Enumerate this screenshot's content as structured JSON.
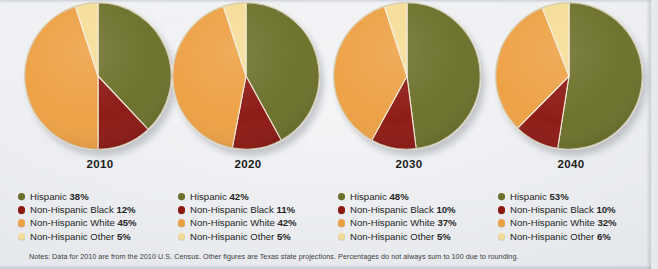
{
  "background_color": "#e7e9ec",
  "palette": {
    "hispanic": "#6b7029",
    "non_hispanic_black": "#8c1812",
    "non_hispanic_white": "#eda043",
    "non_hispanic_other": "#f5dc96"
  },
  "notes": "Notes: Data for 2010 are from the 2010 U.S. Census. Other figures are Texas state projections. Percentages do not always sum to 100 due to rounding.",
  "chart_data": [
    {
      "type": "pie",
      "title": "2010",
      "categories": [
        "Hispanic",
        "Non-Hispanic Black",
        "Non-Hispanic White",
        "Non-Hispanic Other"
      ],
      "values": [
        38,
        12,
        45,
        5
      ],
      "labels": [
        "38%",
        "12%",
        "45%",
        "5%"
      ],
      "colors": [
        "#6b7029",
        "#8c1812",
        "#eda043",
        "#f5dc96"
      ],
      "legend_position": "below",
      "start_angle": 0,
      "direction": "clockwise"
    },
    {
      "type": "pie",
      "title": "2020",
      "categories": [
        "Hispanic",
        "Non-Hispanic Black",
        "Non-Hispanic White",
        "Non-Hispanic Other"
      ],
      "values": [
        42,
        11,
        42,
        5
      ],
      "labels": [
        "42%",
        "11%",
        "42%",
        "5%"
      ],
      "colors": [
        "#6b7029",
        "#8c1812",
        "#eda043",
        "#f5dc96"
      ],
      "legend_position": "below",
      "start_angle": 0,
      "direction": "clockwise"
    },
    {
      "type": "pie",
      "title": "2030",
      "categories": [
        "Hispanic",
        "Non-Hispanic Black",
        "Non-Hispanic White",
        "Non-Hispanic Other"
      ],
      "values": [
        48,
        10,
        37,
        5
      ],
      "labels": [
        "48%",
        "10%",
        "37%",
        "5%"
      ],
      "colors": [
        "#6b7029",
        "#8c1812",
        "#eda043",
        "#f5dc96"
      ],
      "legend_position": "below",
      "start_angle": 0,
      "direction": "clockwise"
    },
    {
      "type": "pie",
      "title": "2040",
      "categories": [
        "Hispanic",
        "Non-Hispanic Black",
        "Non-Hispanic White",
        "Non-Hispanic Other"
      ],
      "values": [
        53,
        10,
        32,
        6
      ],
      "labels": [
        "53%",
        "10%",
        "32%",
        "6%"
      ],
      "colors": [
        "#6b7029",
        "#8c1812",
        "#eda043",
        "#f5dc96"
      ],
      "legend_position": "below",
      "start_angle": 0,
      "direction": "clockwise"
    }
  ]
}
